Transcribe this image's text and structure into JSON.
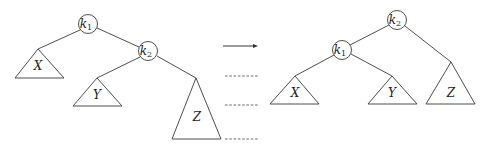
{
  "diagram": {
    "before": {
      "nodes": [
        {
          "id": "k1",
          "label": "k",
          "sub": "1",
          "cx": 88,
          "cy": 24
        },
        {
          "id": "k2",
          "label": "k",
          "sub": "2",
          "cx": 148,
          "cy": 51
        }
      ],
      "subtrees": [
        {
          "id": "X",
          "label": "X",
          "apex": [
            38,
            49
          ],
          "base_y": 78,
          "half": 24,
          "lx": 38,
          "ly": 70
        },
        {
          "id": "Y",
          "label": "Y",
          "apex": [
            97,
            78
          ],
          "base_y": 106,
          "half": 24,
          "lx": 97,
          "ly": 99
        },
        {
          "id": "Z",
          "label": "Z",
          "apex": [
            196,
            78
          ],
          "base_y": 139,
          "half": 24,
          "lx": 197,
          "ly": 121
        }
      ]
    },
    "after": {
      "nodes": [
        {
          "id": "k2",
          "label": "k",
          "sub": "2",
          "cx": 397,
          "cy": 20
        },
        {
          "id": "k1",
          "label": "k",
          "sub": "1",
          "cx": 342,
          "cy": 50
        }
      ],
      "subtrees": [
        {
          "id": "X",
          "label": "X",
          "apex": [
            295,
            76
          ],
          "base_y": 104,
          "half": 24,
          "lx": 295,
          "ly": 97
        },
        {
          "id": "Y",
          "label": "Y",
          "apex": [
            392,
            76
          ],
          "base_y": 104,
          "half": 24,
          "lx": 392,
          "ly": 97
        },
        {
          "id": "Z",
          "label": "Z",
          "apex": [
            451,
            62
          ],
          "base_y": 104,
          "half": 24,
          "lx": 451,
          "ly": 97
        }
      ]
    },
    "arrow": {
      "x1": 223,
      "x2": 258,
      "y": 46
    },
    "level_guides": [
      76,
      105,
      139
    ],
    "colors": {
      "stroke": "#3a3a3a",
      "background": "#ffffff"
    }
  }
}
